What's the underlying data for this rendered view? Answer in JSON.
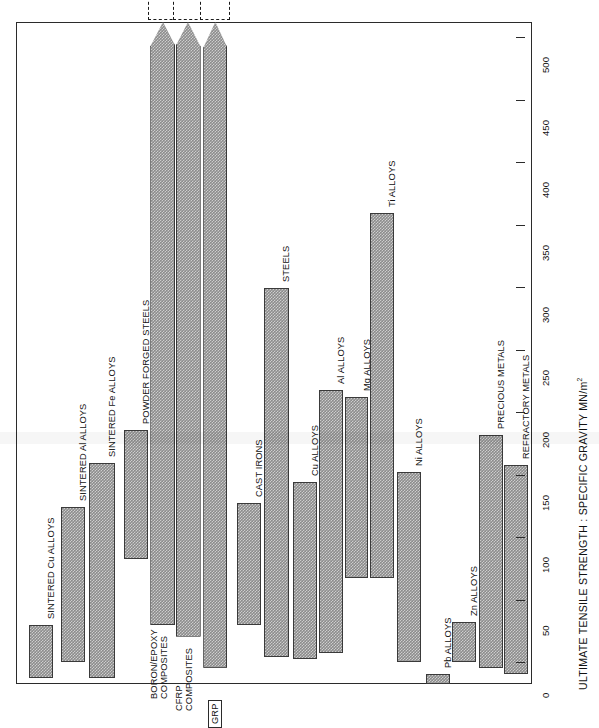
{
  "chart": {
    "type": "bar",
    "orientation": "vertical-bars-rotated-page",
    "axis_title": "ULTIMATE TENSILE STRENGTH : SPECIFIC GRAVITY MN/m",
    "axis_title_superscript": "2",
    "units": "MN/m2"
  },
  "axis": {
    "min": 0,
    "max": 530,
    "tick_values": [
      0,
      50,
      100,
      150,
      200,
      250,
      300,
      350,
      400,
      450,
      500
    ],
    "tick_labels": [
      "0",
      "50",
      "100",
      "150",
      "200",
      "250",
      "300",
      "350",
      "400",
      "450",
      "500"
    ]
  },
  "chart_data": {
    "type": "bar",
    "title": "",
    "xlabel": "",
    "ylabel": "ULTIMATE TENSILE STRENGTH : SPECIFIC GRAVITY MN/m2",
    "ylim": [
      0,
      530
    ],
    "grid": false,
    "legend": "none",
    "value_kind": "range",
    "categories": [
      "SINTERED Cu ALLOYS",
      "SINTERED Al ALLOYS",
      "SINTERED Fe ALLOYS",
      "POWDER FORGED STEELS",
      "BORON/EPOXY COMPOSITES",
      "CFRP COMPOSITES",
      "GRP",
      "CAST IRONS",
      "STEELS",
      "Cu ALLOYS",
      "Al ALLOYS",
      "Mg ALLOYS",
      "Ti ALLOYS",
      "Ni ALLOYS",
      "Pb ALLOYS",
      "Zn ALLOYS",
      "PRECIOUS METALS",
      "REFRACTORY METALS"
    ],
    "bars": [
      {
        "label": "SINTERED Cu ALLOYS",
        "low": 5,
        "high": 47,
        "offscale": false,
        "label_lines": [
          "SINTERED Cu ALLOYS"
        ]
      },
      {
        "label": "SINTERED Al ALLOYS",
        "low": 18,
        "high": 142,
        "offscale": false,
        "label_lines": [
          "SINTERED Al ALLOYS"
        ]
      },
      {
        "label": "SINTERED Fe ALLOYS",
        "low": 5,
        "high": 177,
        "offscale": false,
        "label_lines": [
          "SINTERED Fe ALLOYS"
        ]
      },
      {
        "label": "POWDER FORGED STEELS",
        "low": 100,
        "high": 203,
        "offscale": false,
        "label_lines": [
          "POWDER FORGED STEELS"
        ]
      },
      {
        "label": "BORON/EPOXY COMPOSITES",
        "low": 47,
        "high": 820,
        "offscale": true,
        "offscale_text": "820 MN/m",
        "label_lines": [
          "BORON/EPOXY",
          "COMPOSITES"
        ]
      },
      {
        "label": "CFRP COMPOSITES",
        "low": 38,
        "high": 960,
        "offscale": true,
        "offscale_text": "960 MN/m",
        "label_lines": [
          "CFRP",
          "COMPOSITES"
        ]
      },
      {
        "label": "GRP",
        "low": 13,
        "high": 690,
        "offscale": true,
        "offscale_text": "690 MN/m",
        "label_lines": [
          "GRP"
        ],
        "boxed_label": true
      },
      {
        "label": "CAST IRONS",
        "low": 47,
        "high": 145,
        "offscale": false,
        "label_lines": [
          "CAST IRONS"
        ]
      },
      {
        "label": "STEELS",
        "low": 22,
        "high": 317,
        "offscale": false,
        "label_lines": [
          "STEELS"
        ]
      },
      {
        "label": "Cu ALLOYS",
        "low": 20,
        "high": 162,
        "offscale": false,
        "label_lines": [
          "Cu ALLOYS"
        ]
      },
      {
        "label": "Al ALLOYS",
        "low": 25,
        "high": 235,
        "offscale": false,
        "label_lines": [
          "Al ALLOYS"
        ]
      },
      {
        "label": "Mg ALLOYS",
        "low": 85,
        "high": 230,
        "offscale": false,
        "label_lines": [
          "Mg ALLOYS"
        ]
      },
      {
        "label": "Ti ALLOYS",
        "low": 85,
        "high": 377,
        "offscale": false,
        "label_lines": [
          "Ti ALLOYS"
        ]
      },
      {
        "label": "Ni ALLOYS",
        "low": 18,
        "high": 170,
        "offscale": false,
        "label_lines": [
          "Ni ALLOYS"
        ]
      },
      {
        "label": "Pb ALLOYS",
        "low": 0,
        "high": 8,
        "offscale": false,
        "label_lines": [
          "Pb ALLOYS"
        ]
      },
      {
        "label": "Zn ALLOYS",
        "low": 18,
        "high": 50,
        "offscale": false,
        "label_lines": [
          "Zn ALLOYS"
        ]
      },
      {
        "label": "PRECIOUS METALS",
        "low": 13,
        "high": 199,
        "offscale": false,
        "label_lines": [
          "PRECIOUS METALS"
        ]
      },
      {
        "label": "REFRACTORY METALS",
        "low": 8,
        "high": 175,
        "offscale": false,
        "label_lines": [
          "REFRACTORY METALS"
        ]
      }
    ]
  },
  "colors": {
    "bar_fill": "#8c8c8c",
    "bar_stroke": "#3a3a3a",
    "frame": "#2b2b2b",
    "text": "#111111",
    "background": "#ffffff"
  }
}
